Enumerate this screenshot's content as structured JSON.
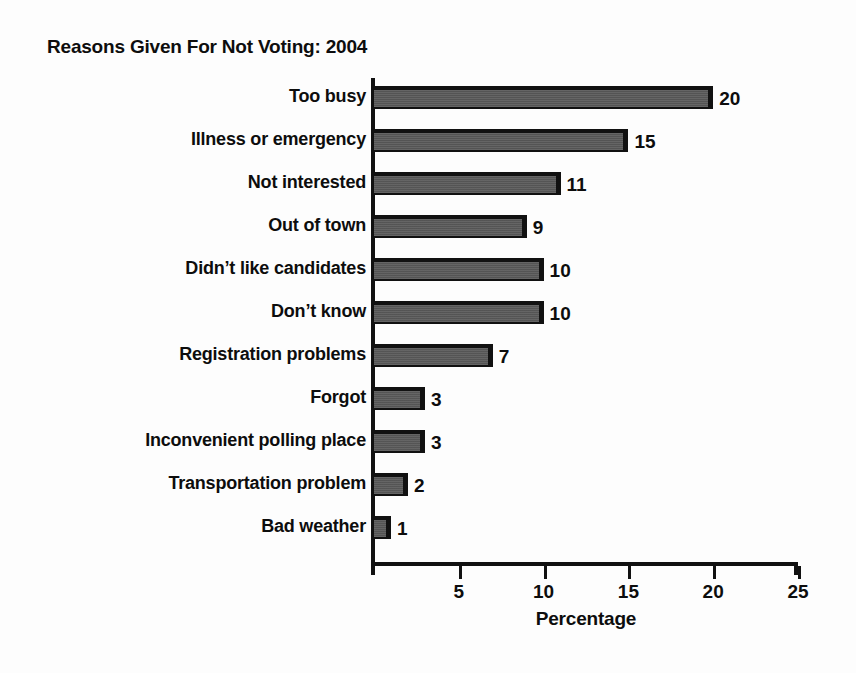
{
  "chart_data": {
    "type": "bar",
    "orientation": "horizontal",
    "title": "Reasons Given For Not Voting: 2004",
    "xlabel": "Percentage",
    "ylabel": "",
    "categories": [
      "Too busy",
      "Illness or emergency",
      "Not interested",
      "Out of town",
      "Didn’t like candidates",
      "Don’t know",
      "Registration problems",
      "Forgot",
      "Inconvenient polling place",
      "Transportation problem",
      "Bad weather"
    ],
    "values": [
      20,
      15,
      11,
      9,
      10,
      10,
      7,
      3,
      3,
      2,
      1
    ],
    "data_labels": [
      "20",
      "15",
      "11",
      "9",
      "10",
      "10",
      "7",
      "3",
      "3",
      "2",
      "1"
    ],
    "xlim": [
      0,
      25
    ],
    "xticks": [
      5,
      10,
      15,
      20,
      25
    ],
    "xtick_labels": [
      "5",
      "10",
      "15",
      "20",
      "25"
    ],
    "grid": false,
    "legend": false,
    "bar_color": "#595959",
    "bar_edge_color": "#111111",
    "text_color": "#0d0d0d",
    "background_color": "#fdfdfd"
  }
}
